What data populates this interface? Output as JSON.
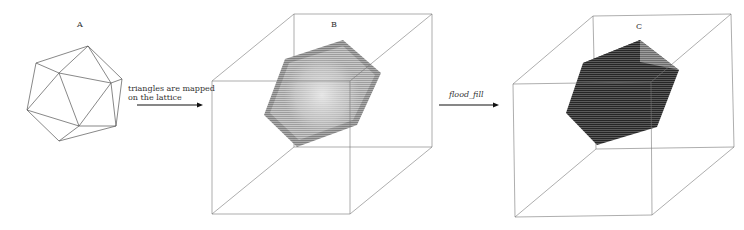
{
  "figure": {
    "panels": [
      {
        "id": "A",
        "label": "A",
        "content": "icosahedron-triangle-mesh"
      },
      {
        "id": "B",
        "label": "B",
        "content": "voxelized-surface-in-lattice-cube"
      },
      {
        "id": "C",
        "label": "C",
        "content": "filled-solid-in-lattice-cube"
      }
    ],
    "steps": [
      {
        "from": "A",
        "to": "B",
        "text_line1": "triangles are mapped",
        "text_line2": "on the lattice"
      },
      {
        "from": "B",
        "to": "C",
        "text": "flood_fill"
      }
    ],
    "colors": {
      "line": "#555555",
      "surface_voxels": "#9a9a9a",
      "filled_voxels": "#3c3c3c",
      "background": "#ffffff"
    }
  }
}
